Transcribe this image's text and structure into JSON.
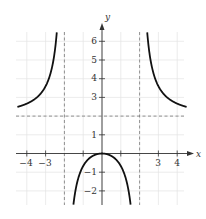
{
  "chart_data": {
    "type": "line",
    "title": "",
    "xlabel": "x",
    "ylabel": "y",
    "xlim": [
      -4.5,
      4.5
    ],
    "ylim": [
      -2.7,
      6.6
    ],
    "grid": true,
    "function": "f(x) = 2x^2 / (x^2 - 4)",
    "x_ticks": [
      -4,
      -3,
      3,
      4
    ],
    "y_ticks": [
      -2,
      -1,
      1,
      3,
      4,
      5,
      6
    ],
    "asymptotes": {
      "vertical": [
        -2,
        2
      ],
      "horizontal": [
        2
      ]
    },
    "series": [
      {
        "name": "left branch",
        "x": [
          -4.5,
          -4,
          -3.5,
          -3,
          -2.5,
          -2.3,
          -2.2
        ],
        "y": [
          2.49,
          2.67,
          2.97,
          3.6,
          5.56,
          8.1,
          11.5
        ]
      },
      {
        "name": "middle branch",
        "x": [
          -1.5,
          -1.2,
          -1,
          -0.5,
          0,
          0.5,
          1,
          1.2,
          1.5
        ],
        "y": [
          -2.57,
          -1.13,
          -0.67,
          -0.13,
          0,
          -0.13,
          -0.67,
          -1.13,
          -2.57
        ]
      },
      {
        "name": "right branch",
        "x": [
          2.2,
          2.3,
          2.5,
          3,
          3.5,
          4,
          4.5
        ],
        "y": [
          11.5,
          8.1,
          5.56,
          3.6,
          2.97,
          2.67,
          2.49
        ]
      }
    ],
    "colors": {
      "curve": "#111111",
      "axis": "#333333",
      "grid": "#e4e4e4",
      "asymptote": "#777777"
    }
  },
  "labels": {
    "x_axis": "x",
    "y_axis": "y",
    "x_ticks": [
      "−4",
      "−3",
      "3",
      "4"
    ],
    "y_ticks": [
      "6",
      "5",
      "4",
      "3",
      "1",
      "−1",
      "−2"
    ]
  }
}
